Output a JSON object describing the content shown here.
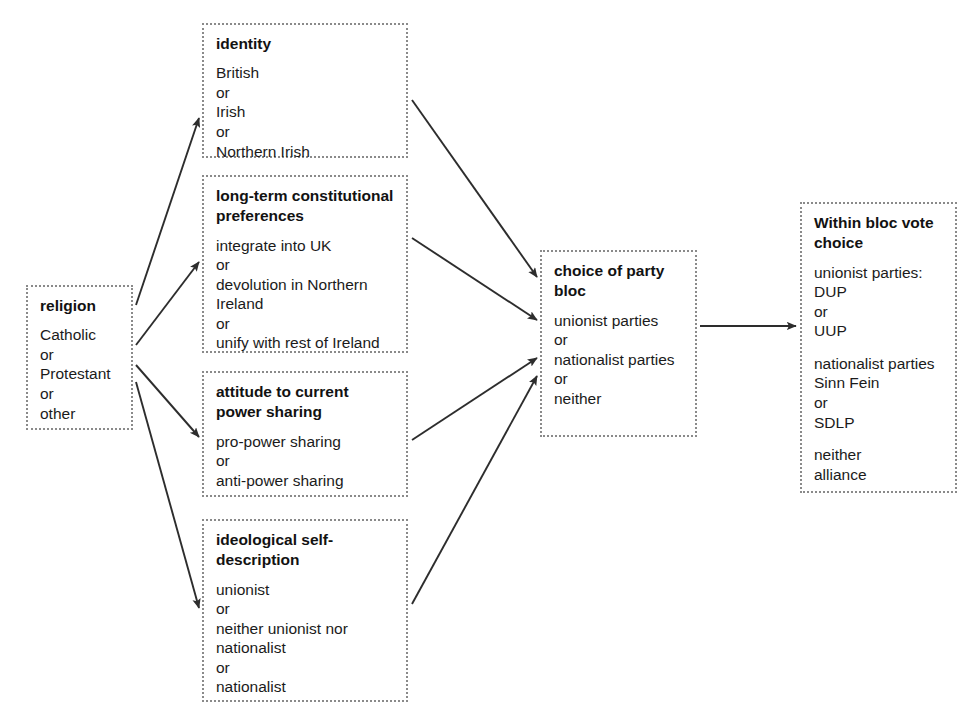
{
  "diagram": {
    "type": "flowchart",
    "title": "",
    "nodes": [
      {
        "id": "religion",
        "title": "religion",
        "body": "Catholic\nor\nProtestant\nor\nother",
        "x": 26,
        "y": 285,
        "w": 107,
        "h": 145
      },
      {
        "id": "identity",
        "title": "identity",
        "body": "British\nor\nIrish\nor\n Northern Irish",
        "x": 202,
        "y": 23,
        "w": 206,
        "h": 135
      },
      {
        "id": "constitutional-preferences",
        "title": "long-term constitutional\npreferences",
        "body": "integrate into UK\nor\ndevolution in Northern\nIreland\nor\nunify with rest of Ireland",
        "x": 202,
        "y": 175,
        "w": 206,
        "h": 178
      },
      {
        "id": "power-sharing",
        "title": "attitude to current\npower sharing",
        "body": "pro-power sharing\nor\nanti-power sharing",
        "x": 202,
        "y": 371,
        "w": 206,
        "h": 126
      },
      {
        "id": "ideological-self-description",
        "title": "ideological self-\ndescription",
        "body": "unionist\nor\nneither unionist nor\nnationalist\nor\nnationalist",
        "x": 202,
        "y": 519,
        "w": 206,
        "h": 183
      },
      {
        "id": "party-bloc",
        "title": "choice of party\nbloc",
        "body": "unionist parties\nor\nnationalist parties\nor\nneither",
        "x": 540,
        "y": 250,
        "w": 157,
        "h": 187
      },
      {
        "id": "within-bloc",
        "title": "Within bloc vote\nchoice",
        "body": "unionist parties:\nDUP\nor\nUUP",
        "body2": "nationalist parties\nSinn Fein\nor\nSDLP",
        "body3": "neither\nalliance",
        "x": 800,
        "y": 202,
        "w": 157,
        "h": 291
      }
    ],
    "edges": [
      {
        "from": "religion",
        "to": "identity",
        "name": "edge-religion-to-identity"
      },
      {
        "from": "religion",
        "to": "constitutional-preferences",
        "name": "edge-religion-to-constitutional-preferences"
      },
      {
        "from": "religion",
        "to": "power-sharing",
        "name": "edge-religion-to-power-sharing"
      },
      {
        "from": "religion",
        "to": "ideological-self-description",
        "name": "edge-religion-to-ideological-self-description"
      },
      {
        "from": "identity",
        "to": "party-bloc",
        "name": "edge-identity-to-party-bloc"
      },
      {
        "from": "constitutional-preferences",
        "to": "party-bloc",
        "name": "edge-constitutional-preferences-to-party-bloc"
      },
      {
        "from": "power-sharing",
        "to": "party-bloc",
        "name": "edge-power-sharing-to-party-bloc"
      },
      {
        "from": "ideological-self-description",
        "to": "party-bloc",
        "name": "edge-ideological-self-description-to-party-bloc"
      },
      {
        "from": "party-bloc",
        "to": "within-bloc",
        "name": "edge-party-bloc-to-within-bloc"
      }
    ],
    "colors": {
      "border": "#8a8a8a",
      "text": "#1b1b1b",
      "arrow": "#2d2d2d",
      "background": "#ffffff"
    }
  }
}
